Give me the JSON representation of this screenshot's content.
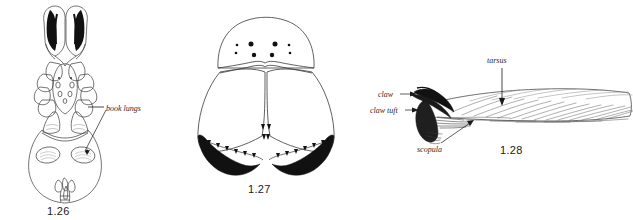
{
  "plate": {
    "background_color": "#ffffff",
    "ink_color": "#111111",
    "line_color": "#3a3a3a"
  },
  "figures": [
    {
      "id": "fig-1-26",
      "caption": "1.26",
      "subject": "spider-ventral-view",
      "annotations": [
        {
          "id": "book-lungs",
          "label": "book lungs"
        }
      ]
    },
    {
      "id": "fig-1-27",
      "caption": "1.27",
      "subject": "spider-chelicerae-frontal-view",
      "eye_count": 8,
      "annotations": []
    },
    {
      "id": "fig-1-28",
      "caption": "1.28",
      "subject": "spider-tarsus-lateral-view",
      "annotations": [
        {
          "id": "claw",
          "label": "claw"
        },
        {
          "id": "claw-tuft",
          "label": "claw tuft"
        },
        {
          "id": "tarsus",
          "label": "tarsus"
        },
        {
          "id": "scopula",
          "label": "scopula"
        }
      ]
    }
  ],
  "captions": {
    "fig126": "1.26",
    "fig127": "1.27",
    "fig128": "1.28"
  },
  "labels": {
    "book_lungs": "book lungs",
    "claw": "claw",
    "claw_tuft": "claw tuft",
    "tarsus": "tarsus",
    "scopula": "scopula"
  }
}
